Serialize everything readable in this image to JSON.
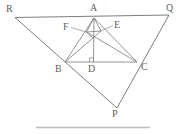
{
  "figure": {
    "canvas": {
      "width": 184,
      "height": 134
    },
    "colors": {
      "background": "#ffffff",
      "outer_stroke": "#6e6e6e",
      "inner_stroke": "#7a7a7a",
      "leader_stroke": "#8a8a8a",
      "baseline_stroke": "#bdbdbd",
      "label_text": "#5f5f5f"
    },
    "points": {
      "R": {
        "label": "R",
        "x": 15.0,
        "y": 17.5,
        "label_x": 6,
        "label_y": 4
      },
      "Q": {
        "label": "Q",
        "x": 169.0,
        "y": 15.0,
        "label_x": 167,
        "label_y": 3
      },
      "A": {
        "label": "A",
        "x": 94.0,
        "y": 18.0,
        "label_x": 90,
        "label_y": 3
      },
      "B": {
        "label": "B",
        "x": 65.0,
        "y": 62.0,
        "label_x": 56,
        "label_y": 65
      },
      "C": {
        "label": "C",
        "x": 137.0,
        "y": 62.0,
        "label_x": 141,
        "label_y": 63
      },
      "D": {
        "label": "D",
        "x": 93.5,
        "y": 62.0,
        "label_x": 89,
        "label_y": 65
      },
      "P": {
        "label": "P",
        "x": 117.0,
        "y": 108.0,
        "label_x": 113,
        "label_y": 110
      },
      "F": {
        "label": "F",
        "x": 86.5,
        "y": 32.0,
        "label_x": 63,
        "label_y": 24
      },
      "E": {
        "label": "E",
        "x": 101.0,
        "y": 31.0,
        "label_x": 114,
        "label_y": 22
      }
    },
    "segments": [
      {
        "name": "side-RQ",
        "from": "R",
        "to": "Q",
        "kind": "outer"
      },
      {
        "name": "side-RP",
        "from": "R",
        "to": "P",
        "kind": "outer"
      },
      {
        "name": "side-QP",
        "from": "Q",
        "to": "P",
        "kind": "outer"
      },
      {
        "name": "side-BC",
        "from": "B",
        "to": "C",
        "kind": "inner"
      },
      {
        "name": "side-AB",
        "from": "A",
        "to": "B",
        "kind": "inner"
      },
      {
        "name": "side-AC",
        "from": "A",
        "to": "C",
        "kind": "inner"
      },
      {
        "name": "altitude-AD",
        "from": "A",
        "to": "D",
        "kind": "inner"
      },
      {
        "name": "cevian-BE",
        "from": "B",
        "to": "E",
        "kind": "inner"
      },
      {
        "name": "cevian-CF",
        "from": "C",
        "to": "F",
        "kind": "inner"
      },
      {
        "name": "cevian-BE-extended",
        "from": "B",
        "to": "A",
        "kind": "inner"
      },
      {
        "name": "cevian-AF-to-C",
        "from": "F",
        "to": "C",
        "kind": "inner"
      }
    ],
    "markers": [
      {
        "name": "right-angle-at-D",
        "at": "D",
        "type": "right-angle",
        "size": 4
      }
    ],
    "leaders": [
      {
        "name": "leader-F",
        "from_label": "F",
        "to_point": "F"
      },
      {
        "name": "leader-E",
        "from_label": "E",
        "to_point": "E"
      }
    ],
    "baseline": {
      "name": "bottom-rule",
      "x1": 36,
      "y1": 127.5,
      "x2": 150,
      "y2": 127.5
    }
  }
}
